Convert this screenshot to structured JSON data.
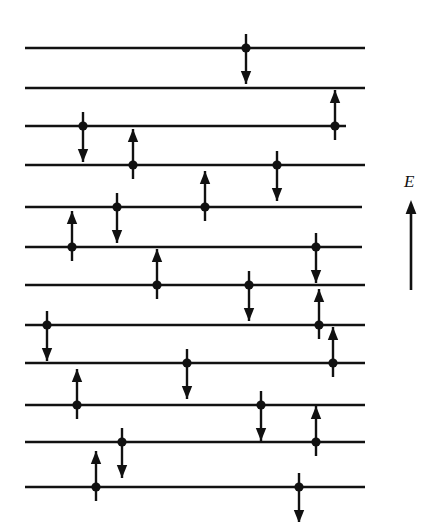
{
  "figure": {
    "background_color": "#ffffff",
    "ink_color": "#111111",
    "width": 437,
    "height": 522
  },
  "axis": {
    "label": "E",
    "meaning": "energy-increases-upward",
    "x": 411,
    "y_top": 200,
    "y_bottom": 290,
    "label_x": 404,
    "label_y": 173
  },
  "levels": [
    {
      "index": 1,
      "y": 48,
      "x_start": 25,
      "x_end": 365,
      "electrons": [
        {
          "x": 246,
          "spin": "down"
        }
      ]
    },
    {
      "index": 2,
      "y": 88,
      "x_start": 25,
      "x_end": 365,
      "electrons": []
    },
    {
      "index": 3,
      "y": 126,
      "x_start": 25,
      "x_end": 346,
      "electrons": [
        {
          "x": 83,
          "spin": "down"
        },
        {
          "x": 335,
          "spin": "up"
        }
      ]
    },
    {
      "index": 4,
      "y": 165,
      "x_start": 25,
      "x_end": 365,
      "electrons": [
        {
          "x": 133,
          "spin": "up"
        },
        {
          "x": 277,
          "spin": "down"
        }
      ]
    },
    {
      "index": 5,
      "y": 207,
      "x_start": 25,
      "x_end": 362,
      "electrons": [
        {
          "x": 117,
          "spin": "down"
        },
        {
          "x": 205,
          "spin": "up"
        }
      ]
    },
    {
      "index": 6,
      "y": 247,
      "x_start": 25,
      "x_end": 362,
      "electrons": [
        {
          "x": 72,
          "spin": "up"
        },
        {
          "x": 316,
          "spin": "down"
        }
      ]
    },
    {
      "index": 7,
      "y": 285,
      "x_start": 25,
      "x_end": 365,
      "electrons": [
        {
          "x": 157,
          "spin": "up"
        },
        {
          "x": 249,
          "spin": "down"
        }
      ]
    },
    {
      "index": 8,
      "y": 325,
      "x_start": 25,
      "x_end": 365,
      "electrons": [
        {
          "x": 47,
          "spin": "down"
        },
        {
          "x": 319,
          "spin": "up"
        }
      ]
    },
    {
      "index": 9,
      "y": 363,
      "x_start": 25,
      "x_end": 365,
      "electrons": [
        {
          "x": 187,
          "spin": "down"
        },
        {
          "x": 333,
          "spin": "up"
        }
      ]
    },
    {
      "index": 10,
      "y": 405,
      "x_start": 25,
      "x_end": 365,
      "electrons": [
        {
          "x": 77,
          "spin": "up"
        },
        {
          "x": 261,
          "spin": "down"
        }
      ]
    },
    {
      "index": 11,
      "y": 442,
      "x_start": 25,
      "x_end": 365,
      "electrons": [
        {
          "x": 122,
          "spin": "down"
        },
        {
          "x": 316,
          "spin": "up"
        }
      ]
    },
    {
      "index": 12,
      "y": 487,
      "x_start": 25,
      "x_end": 365,
      "electrons": [
        {
          "x": 96,
          "spin": "up"
        },
        {
          "x": 299,
          "spin": "down"
        }
      ]
    }
  ],
  "geometry": {
    "dot_radius": 4.6,
    "arrow_length": 36,
    "arrow_head_length": 13,
    "arrow_head_half_width": 5.2,
    "arrow_stem_overshoot": 14
  }
}
